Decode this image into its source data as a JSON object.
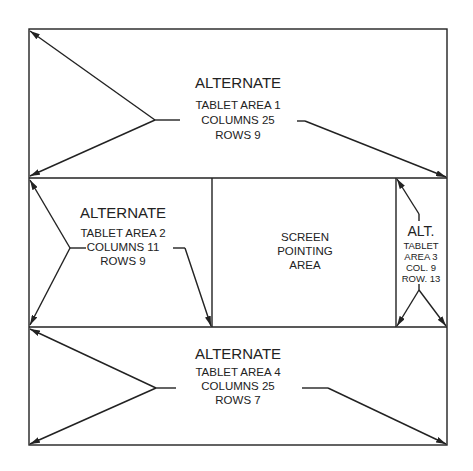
{
  "diagram": {
    "area1": {
      "title": "ALTERNATE",
      "line1": "TABLET AREA 1",
      "line2": "COLUMNS 25",
      "line3": "ROWS 9"
    },
    "area2": {
      "title": "ALTERNATE",
      "line1": "TABLET AREA 2",
      "line2": "COLUMNS 11",
      "line3": "ROWS 9"
    },
    "screen": {
      "line1": "SCREEN",
      "line2": "POINTING",
      "line3": "AREA"
    },
    "area3": {
      "title": "ALT.",
      "line1": "TABLET",
      "line2": "AREA 3",
      "line3": "COL. 9",
      "line4": "ROW. 13"
    },
    "area4": {
      "title": "ALTERNATE",
      "line1": "TABLET AREA 4",
      "line2": "COLUMNS 25",
      "line3": "ROWS 7"
    }
  },
  "colors": {
    "line": "#222222",
    "background": "#ffffff"
  }
}
